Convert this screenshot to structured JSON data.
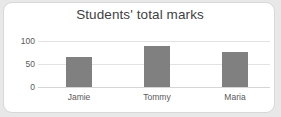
{
  "chart_data": {
    "type": "bar",
    "title": "Students' total marks",
    "xlabel": "",
    "ylabel": "",
    "categories": [
      "Jamie",
      "Tommy",
      "Maria"
    ],
    "values": [
      65,
      89,
      76
    ],
    "series": [
      {
        "name": "total marks",
        "values": [
          65,
          89,
          76
        ]
      }
    ],
    "ylim": [
      0,
      100
    ],
    "yticks": [
      0,
      50,
      100
    ],
    "ytick_labels": [
      "0",
      "50",
      "100"
    ],
    "data_labels": [
      "65",
      "89",
      "76"
    ],
    "grid": true,
    "legend": false,
    "bar_color": "#808080",
    "title_color": "#3f3f3f",
    "tick_color": "#595959",
    "gridline_color": "#e2e2e2",
    "card_background": "#ffffff",
    "page_background": "#e8e8e8"
  }
}
